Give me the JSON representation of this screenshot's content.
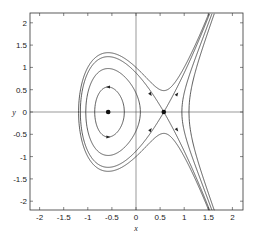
{
  "chart_data": {
    "type": "line",
    "title": "",
    "subtitle": "",
    "xlabel": "x",
    "ylabel": "y",
    "xlim": [
      -2.2,
      2.25
    ],
    "ylim": [
      -2.2,
      2.2
    ],
    "grid": false,
    "legend": null,
    "x_ticks": [
      -2,
      -1.5,
      -1,
      -0.5,
      0,
      0.5,
      1,
      1.5,
      2
    ],
    "x_tick_labels": [
      "-2",
      "-1.5",
      "-1",
      "-0.5",
      "0",
      "0.5",
      "1",
      "1.5",
      "2"
    ],
    "y_ticks": [
      -2,
      -1.5,
      -1,
      -0.5,
      0,
      0.5,
      1,
      1.5,
      2
    ],
    "y_tick_labels": [
      "-2",
      "-1.5",
      "-1",
      "-0.5",
      "0",
      "0.5",
      "1",
      "1.5",
      "2"
    ],
    "hamiltonian": {
      "form": "H = y^2/2 + x - x^3",
      "a": 1,
      "b": -1
    },
    "level_curves": [
      {
        "name": "closed orbit around center",
        "h": -0.228
      },
      {
        "name": "right open curve",
        "h": 0.09
      },
      {
        "name": "separatrix",
        "h": 0.385
      },
      {
        "name": "outer curve",
        "h": 0.5
      }
    ],
    "equilibria": [
      {
        "type": "center",
        "x": -0.577,
        "y": 0
      },
      {
        "type": "saddle",
        "x": 0.577,
        "y": 0
      }
    ],
    "arrows": [
      {
        "x": -0.577,
        "y": 0.56,
        "dir": "left"
      },
      {
        "x": -0.577,
        "y": -0.56,
        "dir": "right"
      },
      {
        "x": 0.3,
        "y": 0.4,
        "dir": "down-right"
      },
      {
        "x": 0.85,
        "y": 0.4,
        "dir": "up-right"
      },
      {
        "x": 0.3,
        "y": -0.4,
        "dir": "up-right"
      },
      {
        "x": 0.85,
        "y": -0.4,
        "dir": "down-right"
      }
    ]
  },
  "plot": {
    "px_left": 30,
    "px_top": 13,
    "px_right": 243,
    "px_bottom": 210,
    "origin_px": [
      136,
      112
    ],
    "px_per_x": 48.2,
    "px_per_y": 44.6
  }
}
